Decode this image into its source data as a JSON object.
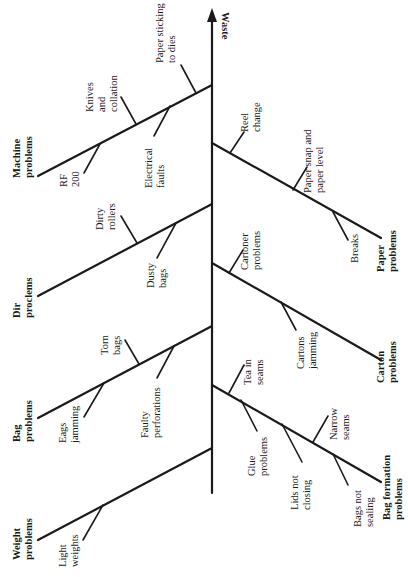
{
  "diagram": {
    "type": "fishbone",
    "effect": "Waste",
    "orientation": "rotated 90 degrees; spine vertical with arrow pointing up",
    "left_categories": [
      {
        "label_lines": [
          "Machine",
          "problems"
        ],
        "causes": [
          {
            "lines": [
              "Paper sticking",
              "to dies"
            ]
          },
          {
            "lines": [
              "Knives",
              "and",
              "collation"
            ]
          },
          {
            "lines": [
              "Electrical",
              "faults"
            ]
          },
          {
            "lines": [
              "RF",
              "200"
            ]
          }
        ]
      },
      {
        "label_lines": [
          "Dir",
          "proclems"
        ],
        "causes": [
          {
            "lines": [
              "Dirty",
              "rollers"
            ]
          },
          {
            "lines": [
              "Dusty",
              "bags"
            ]
          }
        ]
      },
      {
        "label_lines": [
          "Bag",
          "problems"
        ],
        "causes": [
          {
            "lines": [
              "Torn",
              "bags"
            ]
          },
          {
            "lines": [
              "Faulty",
              "perforations"
            ]
          },
          {
            "lines": [
              "Eags",
              "jamming"
            ]
          }
        ]
      },
      {
        "label_lines": [
          "Weight",
          "problems"
        ],
        "causes": [
          {
            "lines": [
              "Light",
              "weights"
            ]
          }
        ]
      }
    ],
    "right_categories": [
      {
        "label_lines": [
          "Paper",
          "problems"
        ],
        "causes": [
          {
            "lines": [
              "Reel",
              "change"
            ]
          },
          {
            "lines": [
              "Paper snap and",
              "paper level"
            ]
          },
          {
            "lines": [
              "Breaks"
            ]
          }
        ]
      },
      {
        "label_lines": [
          "Carton",
          "problems"
        ],
        "causes": [
          {
            "lines": [
              "Cartoner",
              "problems"
            ]
          },
          {
            "lines": [
              "Cartons",
              "jamming"
            ]
          }
        ]
      },
      {
        "label_lines": [
          "Bag formation",
          "problems"
        ],
        "causes": [
          {
            "lines": [
              "Tea in",
              "seams"
            ]
          },
          {
            "lines": [
              "Glue",
              "problems"
            ]
          },
          {
            "lines": [
              "Lids not",
              "closing"
            ]
          },
          {
            "lines": [
              "Narrow",
              "seams"
            ]
          },
          {
            "lines": [
              "Bags not",
              "sealing"
            ]
          }
        ]
      }
    ]
  }
}
